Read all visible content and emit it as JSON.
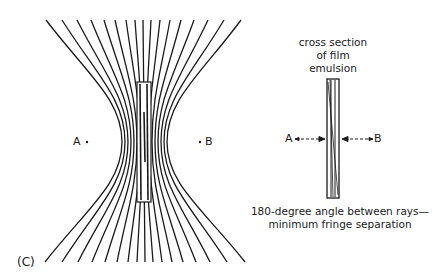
{
  "figure": {
    "panel_label": "(C)",
    "left_diagram": {
      "point_a_label": "A",
      "point_b_label": "B",
      "ray_count": 17,
      "waist_y": 142,
      "film": {
        "x": 137,
        "y": 82,
        "width": 14,
        "height": 120
      },
      "rays_top_x": [
        46,
        62,
        77,
        91,
        104,
        115,
        126,
        135,
        143,
        151,
        160,
        170,
        181,
        194,
        208,
        224,
        241
      ],
      "rays_waist_x": [
        122,
        125,
        128,
        131,
        134,
        137,
        140,
        142,
        144,
        146,
        149,
        152,
        155,
        158,
        161,
        164,
        167
      ],
      "rays_bottom_x": [
        45,
        62,
        78,
        92,
        105,
        117,
        128,
        137,
        145,
        153,
        162,
        172,
        183,
        196,
        210,
        227,
        245
      ]
    },
    "right_diagram": {
      "title_lines": [
        "cross section",
        "of film",
        "emulsion"
      ],
      "point_a_label": "A",
      "point_b_label": "B",
      "caption_lines": [
        "180-degree angle between rays—",
        "minimum fringe separation"
      ]
    },
    "colors": {
      "ink": "#1a1a1a",
      "background": "#ffffff"
    }
  }
}
